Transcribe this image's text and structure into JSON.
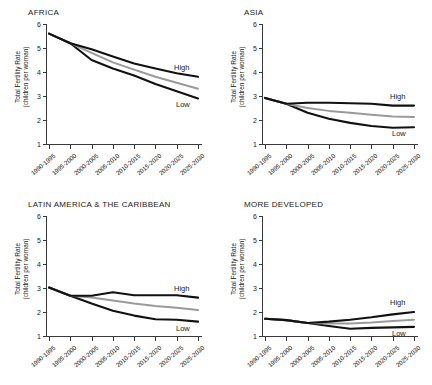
{
  "figure": {
    "axis_label_line1": "Total Fertility Rate",
    "axis_label_line2": "(children per woman)",
    "series_label_high": "High",
    "series_label_medium": "Medium",
    "series_label_low": "Low",
    "color_high": "#111111",
    "color_medium": "#9a9a9a",
    "color_low": "#111111"
  },
  "chart_data": [
    {
      "type": "line",
      "title": "AFRICA",
      "xlabel": "",
      "ylabel": "Total Fertility Rate (children per woman)",
      "categories": [
        "1990-1995",
        "1995-2000",
        "2000-2005",
        "2005-2010",
        "2010-2015",
        "2015-2020",
        "2020-2025",
        "2025-2030"
      ],
      "ylim": [
        1,
        6
      ],
      "yticks": [
        1,
        2,
        3,
        4,
        5,
        6
      ],
      "grid": false,
      "legend_position": "inline-right",
      "series": [
        {
          "name": "High",
          "values": [
            5.6,
            5.2,
            4.95,
            4.65,
            4.35,
            4.15,
            3.95,
            3.8
          ]
        },
        {
          "name": "Medium",
          "values": [
            5.6,
            5.2,
            4.8,
            4.4,
            4.1,
            3.8,
            3.55,
            3.3
          ]
        },
        {
          "name": "Low",
          "values": [
            5.6,
            5.2,
            4.5,
            4.15,
            3.85,
            3.5,
            3.2,
            2.9
          ]
        }
      ]
    },
    {
      "type": "line",
      "title": "ASIA",
      "xlabel": "",
      "ylabel": "Total Fertility Rate (children per woman)",
      "categories": [
        "1990-1995",
        "1995-2000",
        "2000-2005",
        "2005-2010",
        "2010-2015",
        "2015-2020",
        "2020-2025",
        "2025-2030"
      ],
      "ylim": [
        1,
        6
      ],
      "yticks": [
        1,
        2,
        3,
        4,
        5,
        6
      ],
      "grid": false,
      "legend_position": "inline-right",
      "series": [
        {
          "name": "High",
          "values": [
            2.92,
            2.68,
            2.72,
            2.72,
            2.7,
            2.68,
            2.6,
            2.6
          ]
        },
        {
          "name": "Medium",
          "values": [
            2.92,
            2.68,
            2.5,
            2.38,
            2.3,
            2.22,
            2.15,
            2.12
          ]
        },
        {
          "name": "Low",
          "values": [
            2.92,
            2.68,
            2.3,
            2.05,
            1.88,
            1.75,
            1.68,
            1.7
          ]
        }
      ]
    },
    {
      "type": "line",
      "title": "LATIN AMERICA & THE CARIBBEAN",
      "xlabel": "",
      "ylabel": "Total Fertility Rate (children per woman)",
      "categories": [
        "1990-1995",
        "1995-2000",
        "2000-2005",
        "2005-2010",
        "2010-2015",
        "2015-2020",
        "2020-2025",
        "2025-2030"
      ],
      "ylim": [
        1,
        6
      ],
      "yticks": [
        1,
        2,
        3,
        4,
        5,
        6
      ],
      "grid": false,
      "legend_position": "inline-right",
      "series": [
        {
          "name": "High",
          "values": [
            3.02,
            2.68,
            2.68,
            2.82,
            2.7,
            2.7,
            2.7,
            2.6
          ]
        },
        {
          "name": "Medium",
          "values": [
            3.02,
            2.68,
            2.6,
            2.48,
            2.35,
            2.25,
            2.18,
            2.08
          ]
        },
        {
          "name": "Low",
          "values": [
            3.02,
            2.68,
            2.35,
            2.05,
            1.85,
            1.7,
            1.68,
            1.6
          ]
        }
      ]
    },
    {
      "type": "line",
      "title": "MORE DEVELOPED",
      "xlabel": "",
      "ylabel": "Total Fertility Rate (children per woman)",
      "categories": [
        "1990-1995",
        "1995-2000",
        "2000-2005",
        "2005-2010",
        "2010-2015",
        "2015-2020",
        "2020-2025",
        "2025-2030"
      ],
      "ylim": [
        1,
        6
      ],
      "yticks": [
        1,
        2,
        3,
        4,
        5,
        6
      ],
      "grid": false,
      "legend_position": "inline-right",
      "series": [
        {
          "name": "High",
          "values": [
            1.72,
            1.66,
            1.54,
            1.6,
            1.68,
            1.78,
            1.9,
            2.0
          ]
        },
        {
          "name": "Medium",
          "values": [
            1.72,
            1.66,
            1.54,
            1.52,
            1.52,
            1.56,
            1.62,
            1.68
          ]
        },
        {
          "name": "Low",
          "values": [
            1.72,
            1.66,
            1.54,
            1.42,
            1.3,
            1.34,
            1.36,
            1.38
          ]
        }
      ]
    }
  ]
}
